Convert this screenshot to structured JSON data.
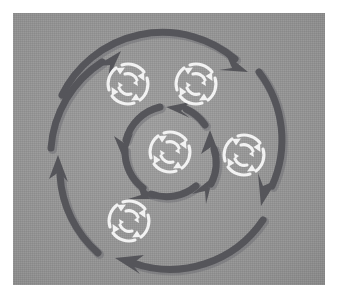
{
  "figure": {
    "title": "Concentric rotating cycle diagram",
    "description": "A grey square plate showing two concentric rings of thick dark-grey curved arrows rotating around a centre, with five small white circular-arrow refresh icons placed at the centre and around it.",
    "canvas": {
      "width": 339,
      "height": 300,
      "plate_x": 13,
      "plate_y": 13,
      "plate_width": 312,
      "plate_height": 272
    },
    "colors": {
      "page_background": "#ffffff",
      "plate_background": "#9a9a9a",
      "arrow_dark": "#55555a",
      "arrow_dark_shadow": "#6b6b70",
      "icon_white": "#f2f2f2",
      "icon_white_soft": "#e2e2e2"
    }
  },
  "chart_data": {
    "type": "diagram",
    "title": "Concentric rotating cycle diagram",
    "center": {
      "x": 170,
      "y": 152
    },
    "rings": [
      {
        "name": "outer-ring",
        "radius": 112,
        "stroke_width": 7,
        "direction": "clockwise",
        "segment_count": 3,
        "segments": [
          {
            "id": "outer-arc-top",
            "label": "outer top arc",
            "start_deg": 183,
            "end_deg": 292,
            "arrowhead_at": "end",
            "arrow_direction": "clockwise"
          },
          {
            "id": "outer-arc-right",
            "label": "outer right arc",
            "start_deg": 300,
            "end_deg": 52,
            "arrowhead_at": "end",
            "arrow_direction": "clockwise"
          },
          {
            "id": "outer-arc-left",
            "label": "outer left / bottom arc",
            "start_deg": 64,
            "end_deg": 172,
            "arrowhead_at": "end",
            "arrow_direction": "clockwise"
          }
        ]
      },
      {
        "name": "outer-ring-secondary",
        "radius": 112,
        "stroke_width": 7,
        "direction": "counter-clockwise",
        "segment_count": 2,
        "segments": [
          {
            "id": "outer-arc-upleft",
            "label": "upper-left arc with up arrow",
            "start_deg": 150,
            "end_deg": 205,
            "arrowhead_at": "start",
            "arrow_direction": "counter-clockwise"
          },
          {
            "id": "outer-arc-bottomarc",
            "label": "bottom arc with left arrow",
            "start_deg": 60,
            "end_deg": 105,
            "arrowhead_at": "end",
            "arrow_direction": "counter-clockwise"
          }
        ]
      },
      {
        "name": "inner-ring",
        "radius": 46,
        "stroke_width": 7,
        "direction": "clockwise",
        "segment_count": 4,
        "segments": [
          {
            "id": "inner-arc-top",
            "label": "inner top arc",
            "start_deg": 312,
            "end_deg": 252,
            "arrowhead_at": "end",
            "arrow_direction": "counter-clockwise"
          },
          {
            "id": "inner-arc-left",
            "label": "inner left arc",
            "start_deg": 240,
            "end_deg": 160,
            "arrowhead_at": "end",
            "arrow_direction": "counter-clockwise"
          },
          {
            "id": "inner-arc-bottom",
            "label": "inner bottom arc",
            "start_deg": 148,
            "end_deg": 60,
            "arrowhead_at": "end",
            "arrow_direction": "counter-clockwise"
          },
          {
            "id": "inner-arc-right",
            "label": "inner right arc",
            "start_deg": 48,
            "end_deg": 340,
            "arrowhead_at": "end",
            "arrow_direction": "counter-clockwise"
          }
        ]
      }
    ],
    "nodes": [
      {
        "id": "icon-center",
        "label": "centre refresh icon",
        "x": 170,
        "y": 152,
        "r": 23,
        "color": "#f2f2f2"
      },
      {
        "id": "icon-top-left",
        "label": "top-left refresh icon",
        "x": 128,
        "y": 84,
        "r": 23,
        "color": "#f2f2f2"
      },
      {
        "id": "icon-top-right",
        "label": "top-right refresh icon",
        "x": 196,
        "y": 84,
        "r": 23,
        "color": "#f2f2f2"
      },
      {
        "id": "icon-right",
        "label": "right refresh icon",
        "x": 244,
        "y": 155,
        "r": 23,
        "color": "#f2f2f2"
      },
      {
        "id": "icon-bottom-left",
        "label": "bottom-left refresh icon",
        "x": 129,
        "y": 221,
        "r": 23,
        "color": "#f2f2f2"
      }
    ],
    "annotations": [],
    "legend": [],
    "grid": false
  },
  "icons": {
    "refresh_icon_name": "refresh-cycle-icon",
    "arc_arrow_icon_name": "curved-arrow-icon"
  },
  "labels": {
    "outer_ring": "Outer rotation ring",
    "inner_ring": "Inner rotation ring",
    "center_node": "Centre node"
  }
}
